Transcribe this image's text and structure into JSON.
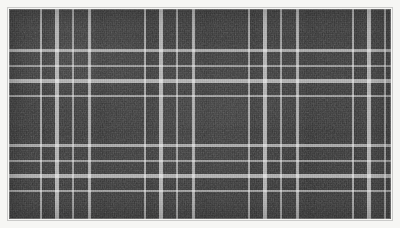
{
  "image": {
    "subject": "plaid-fabric-swatch",
    "description": "Charcoal grey woven plaid textile with white crossing stripes",
    "width_px": 400,
    "height_px": 228
  },
  "frame": {
    "border_color": "#f6f6f4",
    "border_width_px": 9,
    "edge_line_color": "#9b9b9b"
  },
  "fabric": {
    "base_color": "#3c3c3c",
    "stripe_color": "#ffffff",
    "weave_light": "#4a4a4a",
    "weave_dark": "#2e2e2e",
    "pattern_name": "plaid",
    "weave_type": "woven",
    "sett": {
      "horizontal_repeat_px": 104,
      "vertical_repeat_px": 95
    },
    "warp_stripes": [
      {
        "offset_px": 31,
        "width_px": 2,
        "opacity": 0.55
      },
      {
        "offset_px": 46,
        "width_px": 4,
        "opacity": 0.62
      },
      {
        "offset_px": 63,
        "width_px": 2,
        "opacity": 0.5
      },
      {
        "offset_px": 79,
        "width_px": 3,
        "opacity": 0.58
      }
    ],
    "weft_stripes": [
      {
        "offset_px": 27,
        "width_px": 2,
        "opacity": 0.5
      },
      {
        "offset_px": 41,
        "width_px": 4,
        "opacity": 0.6
      },
      {
        "offset_px": 57,
        "width_px": 2,
        "opacity": 0.48
      },
      {
        "offset_px": 72,
        "width_px": 3,
        "opacity": 0.56
      }
    ]
  }
}
